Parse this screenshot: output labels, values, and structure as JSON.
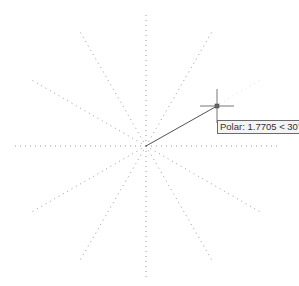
{
  "viewport": {
    "width": 299,
    "height": 286
  },
  "polar_tracking": {
    "origin": {
      "x": 146,
      "y": 146
    },
    "radius": 132,
    "increment_deg": 30,
    "angles_deg": [
      0,
      30,
      60,
      90,
      120,
      150,
      180,
      210,
      240,
      270,
      300,
      330
    ],
    "guide_color": "#9a9a9a",
    "active_angle_deg": 30
  },
  "rubber_band_line": {
    "from": {
      "x": 146,
      "y": 146
    },
    "to": {
      "x": 217,
      "y": 106
    },
    "color": "#555555"
  },
  "cursor": {
    "x": 217,
    "y": 106,
    "arm": 17,
    "color": "#777777"
  },
  "tooltip": {
    "text": "Polar: 1.7705 < 30°"
  }
}
